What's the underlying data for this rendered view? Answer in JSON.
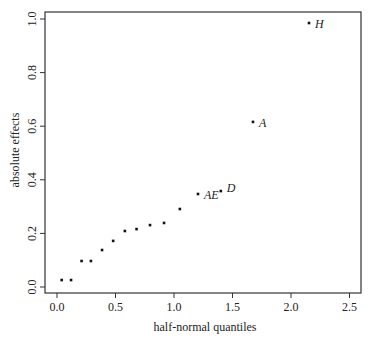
{
  "chart_data": {
    "type": "scatter",
    "title": "",
    "xlabel": "half-normal quantiles",
    "ylabel": "absolute effects",
    "xlim": [
      -0.1,
      2.6
    ],
    "ylim": [
      -0.02,
      1.04
    ],
    "xticks": [
      0.0,
      0.5,
      1.0,
      1.5,
      2.0,
      2.5
    ],
    "xtick_labels": [
      "0.0",
      "0.5",
      "1.0",
      "1.5",
      "2.0",
      "2.5"
    ],
    "yticks": [
      0.0,
      0.2,
      0.4,
      0.6,
      0.8,
      1.0
    ],
    "ytick_labels": [
      "0.0",
      "0.2",
      "0.4",
      "0.6",
      "0.8",
      "1.0"
    ],
    "grid": false,
    "legend": null,
    "points": [
      {
        "x": 0.04,
        "y": 0.026,
        "label": ""
      },
      {
        "x": 0.12,
        "y": 0.026,
        "label": ""
      },
      {
        "x": 0.21,
        "y": 0.097,
        "label": ""
      },
      {
        "x": 0.29,
        "y": 0.097,
        "label": ""
      },
      {
        "x": 0.385,
        "y": 0.138,
        "label": ""
      },
      {
        "x": 0.48,
        "y": 0.172,
        "label": ""
      },
      {
        "x": 0.58,
        "y": 0.209,
        "label": ""
      },
      {
        "x": 0.68,
        "y": 0.216,
        "label": ""
      },
      {
        "x": 0.795,
        "y": 0.231,
        "label": ""
      },
      {
        "x": 0.915,
        "y": 0.239,
        "label": ""
      },
      {
        "x": 1.05,
        "y": 0.291,
        "label": ""
      },
      {
        "x": 1.205,
        "y": 0.347,
        "label": "AE"
      },
      {
        "x": 1.4,
        "y": 0.358,
        "label": "D"
      },
      {
        "x": 1.675,
        "y": 0.616,
        "label": "A"
      },
      {
        "x": 2.154,
        "y": 0.985,
        "label": "H"
      }
    ]
  }
}
